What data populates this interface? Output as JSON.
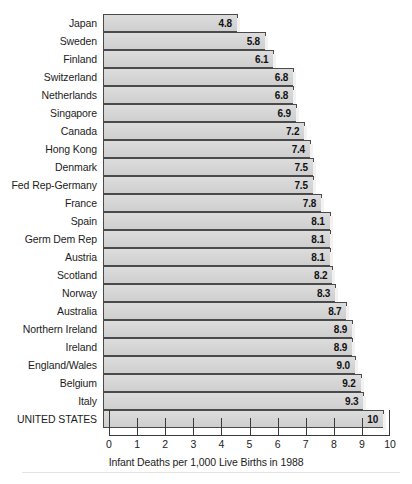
{
  "chart_data": {
    "type": "bar",
    "orientation": "horizontal",
    "title": "",
    "xlabel": "Infant Deaths per 1,000 Live Births in 1988",
    "ylabel": "",
    "xlim": [
      0,
      10
    ],
    "grid": false,
    "legend": null,
    "xticks": [
      "0",
      "1",
      "2",
      "3",
      "4",
      "5",
      "6",
      "7",
      "8",
      "9",
      "10"
    ],
    "categories": [
      "Japan",
      "Sweden",
      "Finland",
      "Switzerland",
      "Netherlands",
      "Singapore",
      "Canada",
      "Hong Kong",
      "Denmark",
      "Fed Rep-Germany",
      "France",
      "Spain",
      "Germ Dem Rep",
      "Austria",
      "Scotland",
      "Norway",
      "Australia",
      "Northern Ireland",
      "Ireland",
      "England/Wales",
      "Belgium",
      "Italy",
      "UNITED STATES"
    ],
    "values": [
      4.8,
      5.8,
      6.1,
      6.8,
      6.8,
      6.9,
      7.2,
      7.4,
      7.5,
      7.5,
      7.8,
      8.1,
      8.1,
      8.1,
      8.2,
      8.3,
      8.7,
      8.9,
      8.9,
      9.0,
      9.2,
      9.3,
      10
    ],
    "value_labels": [
      "4.8",
      "5.8",
      "6.1",
      "6.8",
      "6.8",
      "6.9",
      "7.2",
      "7.4",
      "7.5",
      "7.5",
      "7.8",
      "8.1",
      "8.1",
      "8.1",
      "8.2",
      "8.3",
      "8.7",
      "8.9",
      "8.9",
      "9.0",
      "9.2",
      "9.3",
      "10"
    ],
    "colors": {
      "bar_fill": "#d6d6d6",
      "bar_border": "#4a4a4a",
      "text": "#1c1c1c",
      "axis": "#3a3a3a",
      "background": "#ffffff",
      "footer_rule": "#e3e3e3"
    }
  }
}
